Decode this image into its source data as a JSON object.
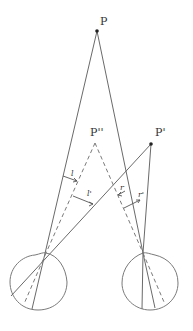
{
  "diagram": {
    "type": "binocular vision geometry",
    "points": {
      "P": {
        "label": "P",
        "x": 97,
        "y": 31
      },
      "P_double_prime": {
        "label": "P''",
        "x": 95,
        "y": 143
      },
      "P_prime": {
        "label": "P'",
        "x": 151,
        "y": 144
      }
    },
    "angle_labels": {
      "l": "l",
      "l_prime": "l'",
      "r": "r",
      "r_prime": "r'"
    },
    "eyes": [
      {
        "name": "left eye",
        "cx": 38,
        "cy": 281,
        "r": 29
      },
      {
        "name": "right eye",
        "cx": 150,
        "cy": 282,
        "r": 28
      }
    ],
    "colors": {
      "line": "#6a6a6a",
      "point": "#222222",
      "text": "#333333"
    }
  }
}
